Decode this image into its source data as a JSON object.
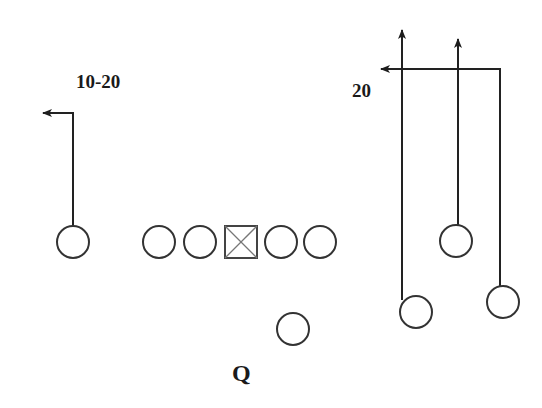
{
  "diagram": {
    "type": "football-play",
    "labels": {
      "left_route": "10-20",
      "right_route": "20",
      "quarterback": "Q"
    },
    "colors": {
      "background": "#ffffff",
      "stroke": "#2a2a2a",
      "center_stroke": "#555555"
    },
    "players": [
      {
        "id": "left-receiver",
        "role": "wide receiver",
        "x": 73,
        "y": 242
      },
      {
        "id": "left-tackle",
        "role": "offensive lineman",
        "x": 159,
        "y": 242
      },
      {
        "id": "left-guard",
        "role": "offensive lineman",
        "x": 200,
        "y": 242
      },
      {
        "id": "center",
        "role": "center",
        "x": 241,
        "y": 242,
        "shape": "x-box"
      },
      {
        "id": "right-guard",
        "role": "offensive lineman",
        "x": 281,
        "y": 242
      },
      {
        "id": "right-tackle",
        "role": "offensive lineman",
        "x": 320,
        "y": 242
      },
      {
        "id": "slot-receiver",
        "role": "receiver",
        "x": 456,
        "y": 241
      },
      {
        "id": "quarterback",
        "role": "quarterback",
        "x": 293,
        "y": 329
      },
      {
        "id": "inside-receiver",
        "role": "receiver",
        "x": 416,
        "y": 312
      },
      {
        "id": "outside-receiver",
        "role": "receiver",
        "x": 503,
        "y": 302
      }
    ],
    "routes": [
      {
        "player": "left-receiver",
        "description": "out route at 10-20 yards",
        "label": "10-20"
      },
      {
        "player": "inside-receiver",
        "description": "go route"
      },
      {
        "player": "slot-receiver",
        "description": "go route"
      },
      {
        "player": "outside-receiver",
        "description": "in/dig route at 20 yards",
        "label": "20"
      }
    ]
  }
}
